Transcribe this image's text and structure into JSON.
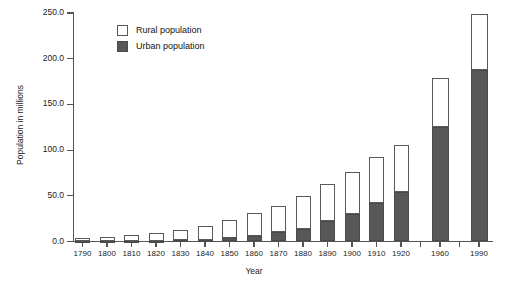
{
  "chart_data": {
    "type": "bar",
    "subtype": "stacked",
    "title": "",
    "xlabel": "Year",
    "ylabel": "Population in millions",
    "ylim": [
      0,
      250
    ],
    "yticks": [
      0,
      50,
      100,
      150,
      200,
      250
    ],
    "ytick_labels": [
      "0.0",
      "50.0",
      "100.0",
      "150.0",
      "200.0",
      "250.0"
    ],
    "grid": false,
    "legend_position": "upper-left-inside",
    "categories": [
      "1790",
      "1800",
      "1810",
      "1820",
      "1830",
      "1840",
      "1850",
      "1860",
      "1870",
      "1880",
      "1890",
      "1900",
      "1910",
      "1920",
      "1960",
      "1990"
    ],
    "series": [
      {
        "name": "Urban population",
        "color": "#585858",
        "values": [
          0.2,
          0.3,
          0.5,
          0.7,
          1.1,
          1.8,
          3.5,
          6.2,
          9.9,
          14.1,
          22.1,
          30.2,
          42.0,
          54.2,
          125.3,
          187.1
        ]
      },
      {
        "name": "Rural population",
        "color": "#ffffff",
        "values": [
          3.7,
          5.0,
          6.7,
          8.9,
          11.7,
          15.2,
          19.6,
          25.2,
          28.7,
          36.0,
          40.8,
          45.8,
          50.0,
          51.6,
          54.0,
          61.7
        ]
      }
    ],
    "totals": [
      3.9,
      5.3,
      7.2,
      9.6,
      12.8,
      17.0,
      23.1,
      31.4,
      38.6,
      50.1,
      62.9,
      76.0,
      92.0,
      105.8,
      179.3,
      248.8
    ]
  },
  "legend": {
    "items": [
      {
        "label": "Rural population",
        "swatch": "open-square-swatch"
      },
      {
        "label": "Urban population",
        "swatch": "filled-square-swatch"
      }
    ]
  },
  "axes": {
    "y_title": "Population in millions",
    "x_title": "Year"
  }
}
